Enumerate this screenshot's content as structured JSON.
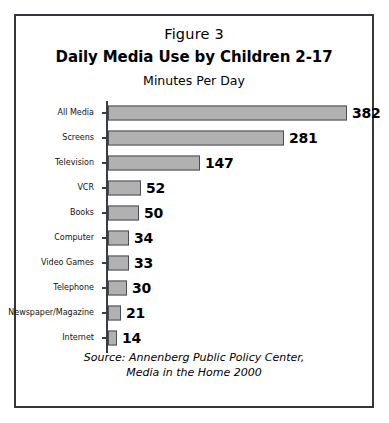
{
  "figure": {
    "label": "Figure 3",
    "title": "Daily Media Use by Children 2-17",
    "subtitle": "Minutes Per Day",
    "source_line1": "Source: Annenberg Public Policy Center,",
    "source_line2": "Media in the Home 2000"
  },
  "colors": {
    "bar_fill": "#b1b1b1",
    "bar_border": "#4a4d52",
    "frame_border": "#33363b",
    "text": "#000000",
    "background": "#ffffff"
  },
  "chart_data": {
    "type": "bar",
    "orientation": "horizontal",
    "title": "Daily Media Use by Children 2-17",
    "subtitle": "Minutes Per Day",
    "xlabel": "",
    "ylabel": "",
    "xlim": [
      0,
      400
    ],
    "grid": false,
    "legend": false,
    "categories": [
      "All Media",
      "Screens",
      "Television",
      "VCR",
      "Books",
      "Computer",
      "Video Games",
      "Telephone",
      "Newspaper/Magazine",
      "Internet"
    ],
    "values": [
      382,
      281,
      147,
      52,
      50,
      34,
      33,
      30,
      21,
      14
    ],
    "value_labels": [
      "382",
      "281",
      "147",
      "52",
      "50",
      "34",
      "33",
      "30",
      "21",
      "14"
    ],
    "source": "Source: Annenberg Public Policy Center, Media in the Home 2000"
  }
}
